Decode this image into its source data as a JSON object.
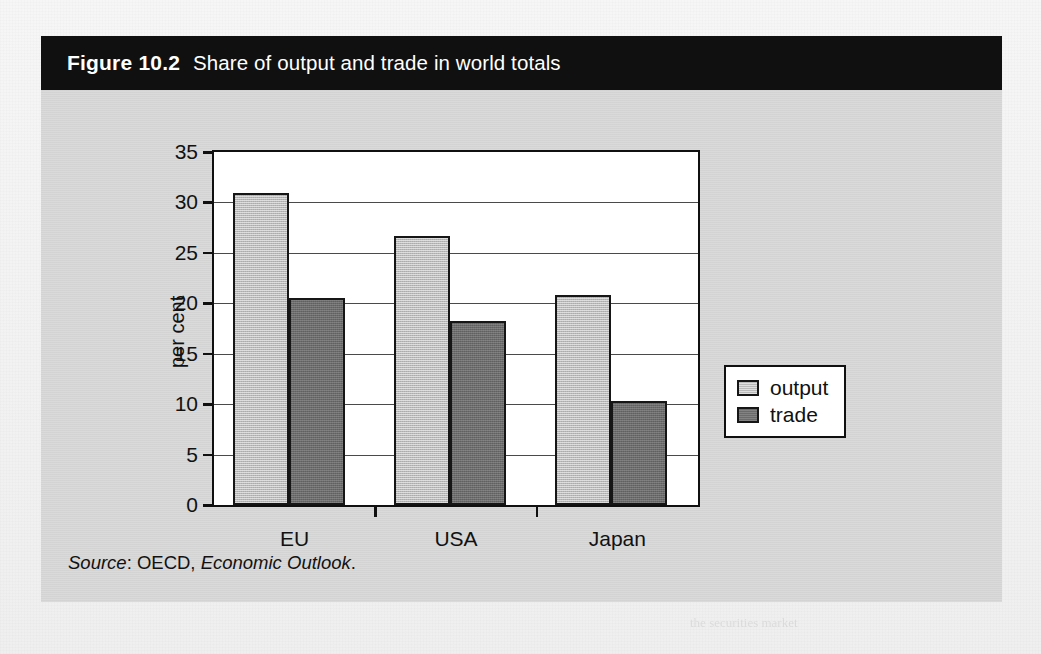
{
  "figure": {
    "number_label": "Figure 10.2",
    "caption": "Share of output and trade in world totals",
    "source_prefix": "Source",
    "source_sep": ": OECD, ",
    "source_publication": "Economic Outlook",
    "source_end": "."
  },
  "legend": {
    "position": "right",
    "items": [
      {
        "label": "output",
        "color": "#b9b9b9"
      },
      {
        "label": "trade",
        "color": "#6b6b6b"
      }
    ]
  },
  "axis": {
    "y_title": "per cent",
    "y_ticks": [
      "0",
      "5",
      "10",
      "15",
      "20",
      "25",
      "30",
      "35"
    ],
    "x_categories": [
      "EU",
      "USA",
      "Japan"
    ]
  },
  "colors": {
    "title_bar_bg": "#101010",
    "title_bar_text": "#ffffff",
    "figure_bg": "#d6d6d6",
    "page_bg": "#f3f3f3",
    "plot_bg": "#ffffff",
    "axis_line": "#101010",
    "gridline": "#4a4a4a",
    "output_fill": "#b9b9b9",
    "trade_fill": "#6b6b6b"
  },
  "ghost_text": {
    "heading_line_1": "2 Conditions for the euro to become an",
    "heading_line_2": "international currency",
    "body_lines": [
      "The size of the economy and its weight in world trade",
      "and finance have a strong influence on the international",
      "role of its currency and its acceptance abroad.",
      "Markets also require depth, breadth and liquidity so that",
      "transactions in the currency can be made quickly, at a",
      "low cost and with little effect on the price. The euro area",
      "meets many of these conditions."
    ],
    "footer_line": "the securities market"
  },
  "chart_data": {
    "type": "bar",
    "title": "Share of output and trade in world totals",
    "xlabel": "",
    "ylabel": "per cent",
    "ylim": [
      0,
      35
    ],
    "ytick_step": 5,
    "grid": true,
    "legend_position": "right",
    "categories": [
      "EU",
      "USA",
      "Japan"
    ],
    "series": [
      {
        "name": "output",
        "color": "#b9b9b9",
        "values": [
          30.9,
          26.7,
          20.8
        ]
      },
      {
        "name": "trade",
        "color": "#6b6b6b",
        "values": [
          20.5,
          18.2,
          10.3
        ]
      }
    ],
    "source": "Source: OECD, Economic Outlook."
  }
}
